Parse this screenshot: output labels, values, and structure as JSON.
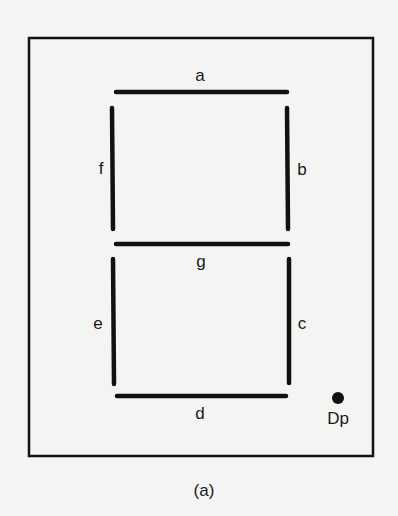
{
  "diagram": {
    "caption": "(a)",
    "segments": {
      "a": "a",
      "b": "b",
      "c": "c",
      "d": "d",
      "e": "e",
      "f": "f",
      "g": "g"
    },
    "decimal_point": "Dp",
    "colors": {
      "ink": "#111111",
      "background": "#f4f4f2"
    }
  }
}
